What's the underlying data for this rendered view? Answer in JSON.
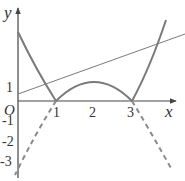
{
  "figure": {
    "type": "function-graph",
    "axes": {
      "x_label": "x",
      "y_label": "y",
      "origin_label": "O",
      "x_ticks": [
        "1",
        "2",
        "3"
      ],
      "y_ticks_positive": [
        "1"
      ],
      "y_ticks_negative": [
        "-1",
        "-2",
        "-3"
      ]
    },
    "curves": [
      {
        "name": "abs-quadratic",
        "style": "solid",
        "description": "y = |-x^2+4x-3|"
      },
      {
        "name": "quadratic-negative-part",
        "style": "dashed",
        "description": "y = -x^2+4x-3 for x<1 and x>3"
      },
      {
        "name": "line",
        "style": "solid-thin",
        "description": "straight line through approx (0,0.35) rising across the arch"
      }
    ],
    "colors": {
      "curve": "#7a7a7a",
      "axis": "#444444",
      "text": "#333333"
    }
  }
}
